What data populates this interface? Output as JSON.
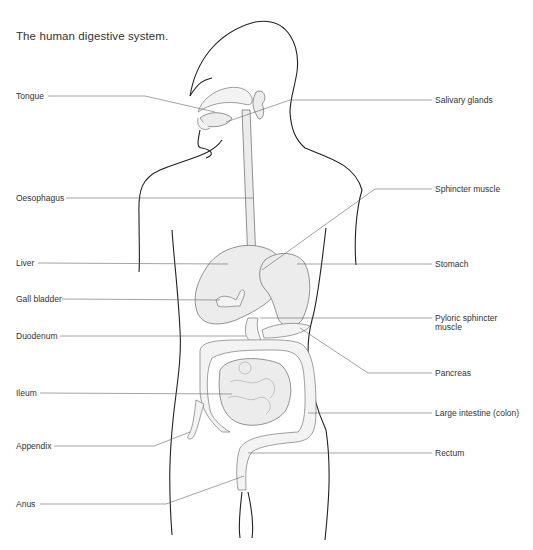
{
  "title": "The human digestive system.",
  "labels": {
    "left": [
      {
        "id": "tongue",
        "text": "Tongue"
      },
      {
        "id": "oesophagus",
        "text": "Oesophagus"
      },
      {
        "id": "liver",
        "text": "Liver"
      },
      {
        "id": "gall_bladder",
        "text": "Gall bladder"
      },
      {
        "id": "duodenum",
        "text": "Duodenum"
      },
      {
        "id": "ileum",
        "text": "Ileum"
      },
      {
        "id": "appendix",
        "text": "Appendix"
      },
      {
        "id": "anus",
        "text": "Anus"
      }
    ],
    "right": [
      {
        "id": "salivary_glands",
        "text": "Salivary glands"
      },
      {
        "id": "sphincter_muscle",
        "text": "Sphincter muscle"
      },
      {
        "id": "stomach",
        "text": "Stomach"
      },
      {
        "id": "pyloric_sphincter",
        "text": "Pyloric sphincter",
        "text2": "muscle"
      },
      {
        "id": "pancreas",
        "text": "Pancreas"
      },
      {
        "id": "large_intestine",
        "text": "Large intestine (colon)"
      },
      {
        "id": "rectum",
        "text": "Rectum"
      }
    ]
  },
  "colors": {
    "outline": "#222222",
    "organ_fill": "#ececec",
    "leader_line": "#666666",
    "text": "#333333"
  }
}
